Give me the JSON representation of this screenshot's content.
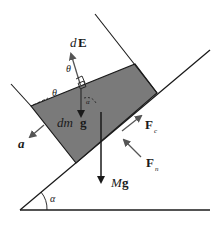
{
  "diagram": {
    "colors": {
      "line": "#1a1a1a",
      "block_fill": "#7a7a7a",
      "arrow_dark": "#1a1a1a",
      "arrow_gray": "#555555",
      "background": "#ffffff"
    },
    "labels": {
      "dE_d": "d",
      "dE_E": "E",
      "theta_top": "θ",
      "theta_left": "θ",
      "alpha_small": "α",
      "dmg_dm": "dm ",
      "dmg_g": "g",
      "a": "a",
      "Fc_F": "F",
      "Fc_sub": "c",
      "Fn_F": "F",
      "Fn_sub": "n",
      "Mg_M": "M",
      "Mg_g": "g",
      "alpha_incline": "α"
    }
  }
}
